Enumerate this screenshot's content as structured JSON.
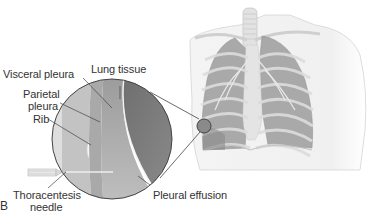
{
  "figure": {
    "panel_label": "B",
    "labels": {
      "visceral_pleura": "Visceral pleura",
      "lung_tissue": "Lung tissue",
      "parietal_pleura_line1": "Parietal",
      "parietal_pleura_line2": "pleura",
      "rib": "Rib",
      "thoracentesis_line1": "Thoracentesis",
      "thoracentesis_line2": "needle",
      "pleural_effusion": "Pleural effusion"
    },
    "colors": {
      "lung_dark": "#7a7a7a",
      "effusion": "#a8a8a8",
      "chest_wall": "#c8c8c8",
      "text": "#333333",
      "line": "#444444"
    }
  }
}
